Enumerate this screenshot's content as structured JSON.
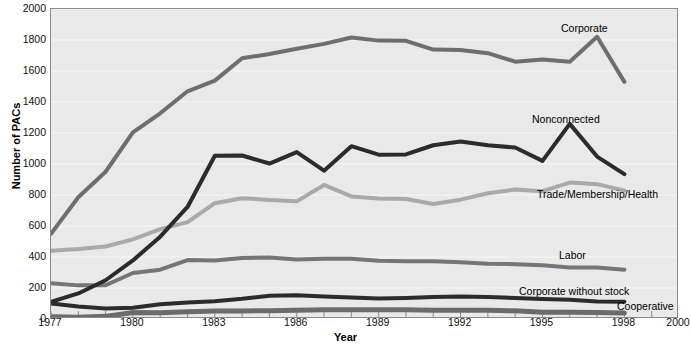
{
  "chart_data": {
    "type": "line",
    "title": "",
    "xlabel": "Year",
    "ylabel": "Number of PACs",
    "xlim": [
      1977,
      2000
    ],
    "ylim": [
      0,
      2000
    ],
    "grid": true,
    "grid_axis": "y",
    "legend": "inline-annotations",
    "x_tick_labels": [
      "1977",
      "1980",
      "1983",
      "1986",
      "1989",
      "1992",
      "1995",
      "1998",
      "2000"
    ],
    "x_tick_values": [
      1977,
      1980,
      1983,
      1986,
      1989,
      1992,
      1995,
      1998,
      2000
    ],
    "x_minor_ticks_every": 1,
    "y_tick_labels": [
      "0",
      "200",
      "400",
      "600",
      "800",
      "1000",
      "1200",
      "1400",
      "1600",
      "1800",
      "2000"
    ],
    "y_tick_values": [
      0,
      200,
      400,
      600,
      800,
      1000,
      1200,
      1400,
      1600,
      1800,
      2000
    ],
    "x": [
      1977,
      1978,
      1979,
      1980,
      1981,
      1982,
      1983,
      1984,
      1985,
      1986,
      1987,
      1988,
      1989,
      1990,
      1991,
      1992,
      1993,
      1994,
      1995,
      1996,
      1997,
      1998
    ],
    "series": [
      {
        "name": "Corporate",
        "color": "#6e6e6e",
        "width": 4,
        "values": [
          550,
          785,
          950,
          1204,
          1327,
          1469,
          1538,
          1682,
          1710,
          1744,
          1775,
          1816,
          1796,
          1795,
          1738,
          1735,
          1715,
          1660,
          1674,
          1660,
          1821,
          1530
        ],
        "label": "Corporate",
        "label_x": 561,
        "label_y": 22
      },
      {
        "name": "Nonconnected",
        "color": "#2b2b2b",
        "width": 4,
        "values": [
          110,
          165,
          250,
          378,
          531,
          723,
          1053,
          1055,
          1003,
          1077,
          957,
          1115,
          1060,
          1062,
          1121,
          1145,
          1121,
          1106,
          1020,
          1259,
          1048,
          935
        ],
        "label": "Nonconnected",
        "label_x": 532,
        "label_y": 113
      },
      {
        "name": "Trade/Membership/Health",
        "color": "#a9a9a9",
        "width": 4,
        "values": [
          440,
          452,
          468,
          514,
          580,
          625,
          747,
          779,
          768,
          759,
          865,
          791,
          778,
          774,
          742,
          770,
          811,
          836,
          825,
          880,
          870,
          828
        ],
        "label": "Trade/Membership/Health",
        "label_x": 537,
        "label_y": 188
      },
      {
        "name": "Labor",
        "color": "#757575",
        "width": 4,
        "values": [
          230,
          217,
          218,
          297,
          318,
          380,
          378,
          394,
          396,
          384,
          389,
          388,
          376,
          372,
          372,
          366,
          357,
          354,
          347,
          332,
          332,
          318
        ],
        "label": "Labor",
        "label_x": 559,
        "label_y": 249
      },
      {
        "name": "Corporate without stock",
        "color": "#2b2b2b",
        "width": 4,
        "values": [
          100,
          80,
          68,
          72,
          95,
          106,
          115,
          130,
          150,
          153,
          145,
          138,
          133,
          136,
          142,
          145,
          142,
          136,
          129,
          124,
          113,
          112
        ],
        "label": "Corporate without stock",
        "label_x": 519,
        "label_y": 285
      },
      {
        "name": "Cooperative",
        "color": "#6b6b6b",
        "width": 5,
        "values": [
          15,
          12,
          17,
          42,
          41,
          47,
          51,
          52,
          54,
          56,
          59,
          59,
          59,
          59,
          57,
          56,
          56,
          53,
          44,
          43,
          42,
          39
        ],
        "label": "Cooperative",
        "label_x": 617,
        "label_y": 300
      }
    ],
    "colors": {
      "plot_background": "#e9e9e9",
      "page_background": "#ffffff",
      "axis": "#8a8a8a",
      "gridline": "#f2f2f2",
      "text": "#111111"
    }
  }
}
